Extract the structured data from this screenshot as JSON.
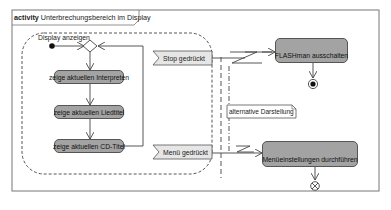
{
  "frame": {
    "keyword": "activity",
    "title": "Unterbrechungsbereich im Display"
  },
  "interruptible_region": {
    "label": "Display anzeigen"
  },
  "actions": [
    {
      "id": "interpret",
      "label": "zeige aktuellen Interpreten"
    },
    {
      "id": "liedtitel",
      "label": "zeige aktuellen Liedtitel"
    },
    {
      "id": "cdtitel",
      "label": "zeige aktuellen CD-Titel"
    }
  ],
  "signals": [
    {
      "id": "stop",
      "label": "Stop gedrückt"
    },
    {
      "id": "menu",
      "label": "Menü gedrückt"
    }
  ],
  "call_actions": [
    {
      "id": "flash",
      "label": "FLASHman ausschalten",
      "icon": "call-behavior-rake-icon"
    },
    {
      "id": "menu-settings",
      "label": "Menüeinstellungen durchführen",
      "icon": "call-behavior-rake-icon"
    }
  ],
  "note": {
    "label": "alternative Darstellung"
  },
  "colors": {
    "action_fill": "#a3a3a3",
    "signal_fill": "#e6e6e6",
    "line": "#444444",
    "frame": "#777777"
  }
}
